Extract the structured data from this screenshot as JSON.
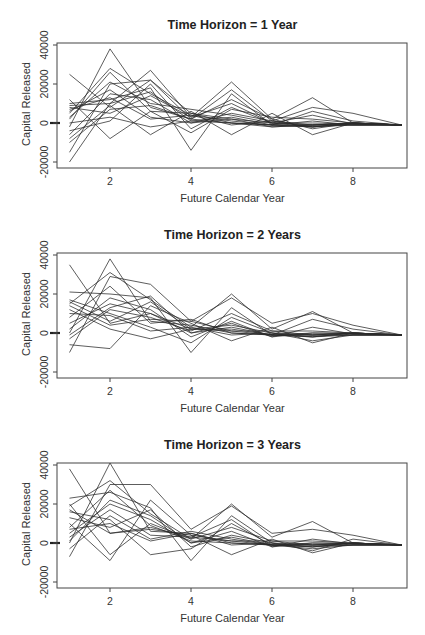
{
  "chart_data": [
    {
      "type": "line",
      "title": "Time Horizon = 1 Year",
      "xlabel": "Future Calendar Year",
      "ylabel": "Capital Released",
      "xticks": [
        2,
        4,
        6,
        8
      ],
      "yticks": [
        -20000,
        0,
        20000,
        40000
      ],
      "xlim": [
        0.7,
        9.4
      ],
      "ylim": [
        -22000,
        42000
      ],
      "grid": false,
      "legend": "none",
      "note": "Many simulated paths (approx. 50); representative series listed; x=9.2 endpoint converges near -1000",
      "x": [
        1,
        2,
        3,
        4,
        5,
        6,
        7,
        8,
        9.2
      ],
      "series": [
        {
          "name": "path-1",
          "values": [
            -2000,
            38000,
            8000,
            2000,
            0,
            -1000,
            -1000,
            0,
            -1000
          ]
        },
        {
          "name": "path-2",
          "values": [
            5000,
            28000,
            15000,
            4000,
            1000,
            -1000,
            -2000,
            -500,
            -1000
          ]
        },
        {
          "name": "path-3",
          "values": [
            25000,
            8000,
            22000,
            5000,
            2000,
            0,
            -1000,
            0,
            -1000
          ]
        },
        {
          "name": "path-4",
          "values": [
            -20000,
            10000,
            27000,
            3000,
            21000,
            2000,
            13000,
            0,
            -1000
          ]
        },
        {
          "name": "path-5",
          "values": [
            -15000,
            20000,
            22000,
            2000,
            17000,
            1000,
            8000,
            5000,
            -1000
          ]
        },
        {
          "name": "path-6",
          "values": [
            10000,
            12000,
            18000,
            -14000,
            15000,
            -1000,
            6000,
            1000,
            -1000
          ]
        },
        {
          "name": "path-7",
          "values": [
            -8000,
            9000,
            -6000,
            6000,
            -6000,
            5000,
            -6000,
            0,
            -1000
          ]
        },
        {
          "name": "path-8",
          "values": [
            12000,
            -8000,
            6000,
            -5000,
            7000,
            3000,
            2000,
            0,
            -1000
          ]
        },
        {
          "name": "path-9",
          "values": [
            3000,
            21000,
            10000,
            7000,
            4000,
            0,
            -2000,
            -1000,
            -1000
          ]
        },
        {
          "name": "path-10",
          "values": [
            -6000,
            15000,
            12000,
            0,
            2000,
            -2000,
            -1000,
            -1000,
            -1000
          ]
        },
        {
          "name": "path-11",
          "values": [
            8000,
            5000,
            14000,
            3000,
            10000,
            0,
            0,
            -500,
            -1000
          ]
        },
        {
          "name": "path-12",
          "values": [
            0,
            3000,
            -2000,
            1000,
            0,
            -1000,
            -2000,
            0,
            -1000
          ]
        },
        {
          "name": "path-13",
          "values": [
            6000,
            17000,
            3000,
            0,
            5000,
            1000,
            -1000,
            -1000,
            -1000
          ]
        },
        {
          "name": "path-14",
          "values": [
            -10000,
            7000,
            9000,
            2000,
            12000,
            2000,
            -3000,
            0,
            -1000
          ]
        },
        {
          "name": "path-15",
          "values": [
            9000,
            10000,
            16000,
            1000,
            3000,
            -1000,
            1000,
            -1000,
            -1000
          ]
        },
        {
          "name": "path-16",
          "values": [
            2000,
            26000,
            6000,
            5000,
            0,
            -2000,
            -1000,
            0,
            -1000
          ]
        },
        {
          "name": "path-17",
          "values": [
            -4000,
            1000,
            20000,
            -3000,
            8000,
            0,
            4000,
            -500,
            -1000
          ]
        },
        {
          "name": "path-18",
          "values": [
            7000,
            13000,
            2000,
            4000,
            -1000,
            1000,
            -2000,
            0,
            -1000
          ]
        }
      ]
    },
    {
      "type": "line",
      "title": "Time Horizon = 2 Years",
      "xlabel": "Future Calendar Year",
      "ylabel": "Capital Released",
      "xticks": [
        2,
        4,
        6,
        8
      ],
      "yticks": [
        -20000,
        0,
        20000,
        40000
      ],
      "xlim": [
        0.7,
        9.4
      ],
      "ylim": [
        -22000,
        42000
      ],
      "grid": false,
      "legend": "none",
      "x": [
        1,
        2,
        3,
        4,
        5,
        6,
        7,
        8,
        9.2
      ],
      "series": [
        {
          "name": "path-1",
          "values": [
            35000,
            5000,
            10000,
            2000,
            1000,
            -1000,
            -1000,
            0,
            -1000
          ]
        },
        {
          "name": "path-2",
          "values": [
            0,
            38000,
            6000,
            4000,
            0,
            -1000,
            -2000,
            0,
            -1000
          ]
        },
        {
          "name": "path-3",
          "values": [
            15000,
            31000,
            17000,
            3000,
            20000,
            2000,
            11000,
            0,
            -1000
          ]
        },
        {
          "name": "path-4",
          "values": [
            -10000,
            29000,
            25000,
            6000,
            18000,
            5000,
            10000,
            4000,
            -1000
          ]
        },
        {
          "name": "path-5",
          "values": [
            21000,
            20000,
            18000,
            -10000,
            13000,
            -1000,
            7000,
            2000,
            -1000
          ]
        },
        {
          "name": "path-6",
          "values": [
            -6000,
            -8000,
            14000,
            5000,
            -4000,
            3000,
            -5000,
            0,
            -1000
          ]
        },
        {
          "name": "path-7",
          "values": [
            17000,
            10000,
            3000,
            -5000,
            8000,
            0,
            -4000,
            -1000,
            -1000
          ]
        },
        {
          "name": "path-8",
          "values": [
            5000,
            15000,
            10000,
            0,
            5000,
            -2000,
            0,
            -500,
            -1000
          ]
        },
        {
          "name": "path-9",
          "values": [
            12000,
            2000,
            -3000,
            2000,
            2000,
            -1000,
            -1000,
            0,
            -1000
          ]
        },
        {
          "name": "path-10",
          "values": [
            8000,
            24000,
            5000,
            7000,
            0,
            -1000,
            -2000,
            -1000,
            -1000
          ]
        },
        {
          "name": "path-11",
          "values": [
            -3000,
            12000,
            8000,
            1000,
            10000,
            1000,
            1000,
            0,
            -1000
          ]
        },
        {
          "name": "path-12",
          "values": [
            16000,
            6000,
            16000,
            2000,
            4000,
            0,
            -1000,
            -1000,
            -1000
          ]
        },
        {
          "name": "path-13",
          "values": [
            2000,
            18000,
            12000,
            -2000,
            6000,
            -2000,
            3000,
            -500,
            -1000
          ]
        },
        {
          "name": "path-14",
          "values": [
            10000,
            9000,
            1000,
            3000,
            -1000,
            0,
            -2000,
            0,
            -1000
          ]
        },
        {
          "name": "path-15",
          "values": [
            14000,
            4000,
            7000,
            6000,
            1000,
            1000,
            -1000,
            -1000,
            -1000
          ]
        },
        {
          "name": "path-16",
          "values": [
            -1000,
            13000,
            19000,
            0,
            3000,
            -1000,
            0,
            0,
            -1000
          ]
        }
      ]
    },
    {
      "type": "line",
      "title": "Time Horizon = 3 Years",
      "xlabel": "Future Calendar Year",
      "ylabel": "Capital Released",
      "xticks": [
        2,
        4,
        6,
        8
      ],
      "yticks": [
        -20000,
        0,
        20000,
        40000
      ],
      "xlim": [
        0.7,
        9.4
      ],
      "ylim": [
        -22000,
        42000
      ],
      "grid": false,
      "legend": "none",
      "x": [
        1,
        2,
        3,
        4,
        5,
        6,
        7,
        8,
        9.2
      ],
      "series": [
        {
          "name": "path-1",
          "values": [
            38000,
            5000,
            8000,
            3000,
            1000,
            -1000,
            -1000,
            0,
            -1000
          ]
        },
        {
          "name": "path-2",
          "values": [
            0,
            41000,
            6000,
            5000,
            0,
            -1000,
            -2000,
            0,
            -1000
          ]
        },
        {
          "name": "path-3",
          "values": [
            19000,
            32000,
            15000,
            2000,
            20000,
            3000,
            11000,
            0,
            -1000
          ]
        },
        {
          "name": "path-4",
          "values": [
            -7000,
            30000,
            30000,
            7000,
            19000,
            5000,
            7000,
            4000,
            -1000
          ]
        },
        {
          "name": "path-5",
          "values": [
            23000,
            26000,
            18000,
            -9000,
            14000,
            0,
            -4000,
            2000,
            -1000
          ]
        },
        {
          "name": "path-6",
          "values": [
            10000,
            -9000,
            22000,
            4000,
            -6000,
            2000,
            -5000,
            0,
            -1000
          ]
        },
        {
          "name": "path-7",
          "values": [
            16000,
            12000,
            -6000,
            -3000,
            10000,
            -1000,
            -3000,
            -1000,
            -1000
          ]
        },
        {
          "name": "path-8",
          "values": [
            5000,
            20000,
            12000,
            0,
            6000,
            -2000,
            0,
            -500,
            -1000
          ]
        },
        {
          "name": "path-9",
          "values": [
            -3000,
            14000,
            2000,
            6000,
            2000,
            -1000,
            -1000,
            0,
            -1000
          ]
        },
        {
          "name": "path-10",
          "values": [
            8000,
            27000,
            9000,
            1000,
            0,
            -1000,
            -2000,
            -1000,
            -1000
          ]
        },
        {
          "name": "path-11",
          "values": [
            20000,
            -6000,
            10000,
            2000,
            8000,
            1000,
            1000,
            0,
            -1000
          ]
        },
        {
          "name": "path-12",
          "values": [
            13000,
            8000,
            17000,
            -2000,
            4000,
            0,
            -1000,
            -1000,
            -1000
          ]
        },
        {
          "name": "path-13",
          "values": [
            3000,
            17000,
            4000,
            3000,
            12000,
            -2000,
            2000,
            -500,
            -1000
          ]
        },
        {
          "name": "path-14",
          "values": [
            7000,
            10000,
            1000,
            5000,
            -1000,
            0,
            -2000,
            0,
            -1000
          ]
        },
        {
          "name": "path-15",
          "values": [
            17000,
            5000,
            7000,
            4000,
            1000,
            1000,
            -1000,
            -1000,
            -1000
          ]
        },
        {
          "name": "path-16",
          "values": [
            1000,
            22000,
            14000,
            0,
            3000,
            -1000,
            0,
            0,
            -1000
          ]
        }
      ]
    }
  ]
}
